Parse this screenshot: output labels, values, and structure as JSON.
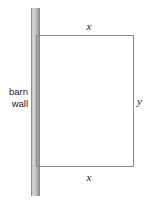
{
  "figure": {
    "type": "geometry-diagram",
    "background_color": "#ffffff",
    "line_color": "#8a8a8a",
    "text_color": "#1a1a1a"
  },
  "barn_wall": {
    "caption_line1": "barn",
    "caption_line2": "wall",
    "fill_color": "#c9c9c9",
    "edge_color": "#8a8a8a"
  },
  "pen": {
    "top_label": "x",
    "bottom_label": "x",
    "right_label": "y"
  }
}
